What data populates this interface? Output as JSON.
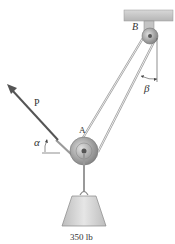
{
  "figure": {
    "labels": {
      "pulley_top": "B",
      "pulley_bottom": "A",
      "force": "P",
      "angle_force": "α",
      "angle_cable": "β",
      "load": "350 lb"
    },
    "colors": {
      "ceiling": "#c9c9c9",
      "cable": "#9a9a9a",
      "pulley": "#a8a8a8",
      "arrow": "#555555",
      "weight": "#d4d4d4"
    }
  }
}
